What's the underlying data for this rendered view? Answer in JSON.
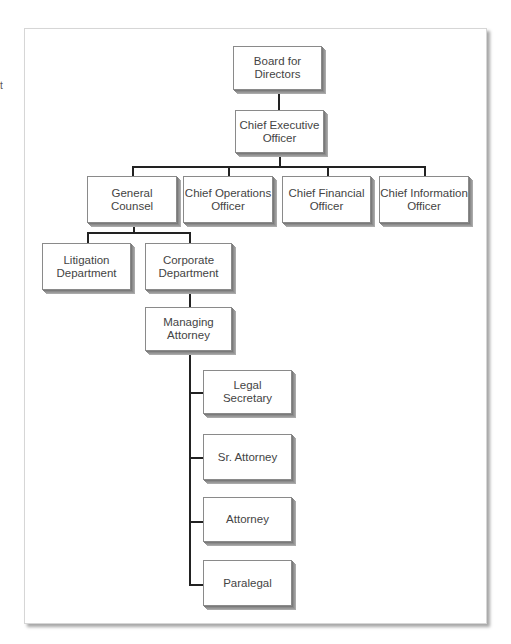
{
  "edge_fragment": "t",
  "chart_title": "",
  "nodes": {
    "board": {
      "line1": "Board for",
      "line2": "Directors"
    },
    "ceo": {
      "line1": "Chief Executive",
      "line2": "Officer"
    },
    "general_counsel": {
      "line1": "General",
      "line2": "Counsel"
    },
    "coo": {
      "line1": "Chief Operations",
      "line2": "Officer"
    },
    "cfo": {
      "line1": "Chief Financial",
      "line2": "Officer"
    },
    "cio": {
      "line1": "Chief Information",
      "line2": "Officer"
    },
    "litigation": {
      "line1": "Litigation",
      "line2": "Department"
    },
    "corporate": {
      "line1": "Corporate",
      "line2": "Department"
    },
    "managing_attorney": {
      "line1": "Managing",
      "line2": "Attorney"
    },
    "legal_secretary": {
      "line1": "Legal",
      "line2": "Secretary"
    },
    "sr_attorney": {
      "line1": "Sr. Attorney"
    },
    "attorney": {
      "line1": "Attorney"
    },
    "paralegal": {
      "line1": "Paralegal"
    }
  },
  "hierarchy": {
    "Board for Directors": [
      "Chief Executive Officer"
    ],
    "Chief Executive Officer": [
      "General Counsel",
      "Chief Operations Officer",
      "Chief Financial Officer",
      "Chief Information Officer"
    ],
    "General Counsel": [
      "Litigation Department",
      "Corporate Department"
    ],
    "Corporate Department": [
      "Managing Attorney"
    ],
    "Managing Attorney": [
      "Legal Secretary",
      "Sr. Attorney",
      "Attorney",
      "Paralegal"
    ]
  },
  "colors": {
    "box_fill": "#ffffff",
    "box_border": "#8a8a8a",
    "bevel": "#999999",
    "connector": "#222222",
    "text": "#444444"
  }
}
